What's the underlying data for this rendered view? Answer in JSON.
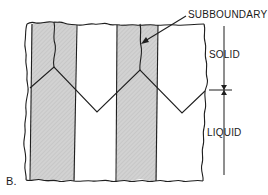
{
  "figure": {
    "panel_label": "B.",
    "labels": {
      "subboundary": "SUBBOUNDARY",
      "solid": "SOLID",
      "liquid": "LIQUID"
    }
  },
  "colors": {
    "line": "#1f1f1f",
    "grain_shade": "#cfcfcf",
    "background": "#ffffff"
  }
}
